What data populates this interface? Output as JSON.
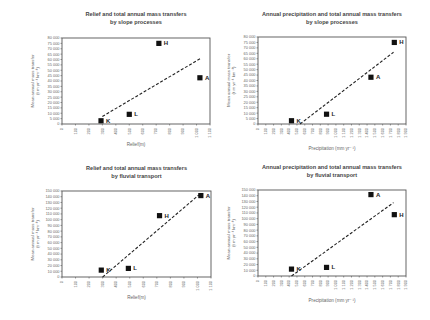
{
  "chart_data": [
    {
      "type": "scatter",
      "title": "Relief and total annual mass transfers by slope processes",
      "title_lines": [
        "Relief and total annual mass transfers",
        "by slope processes"
      ],
      "xlabel": "Relief(m)",
      "ylabel_lines": [
        "Mean annual mass transfer",
        "(t m yr⁻¹ km⁻¹)"
      ],
      "xlim": [
        0,
        1100
      ],
      "ylim": [
        0,
        80000
      ],
      "xticks": [
        0,
        100,
        200,
        300,
        400,
        500,
        600,
        700,
        800,
        900,
        1000,
        1100
      ],
      "yticks": [
        0,
        5000,
        10000,
        15000,
        20000,
        25000,
        30000,
        35000,
        40000,
        45000,
        50000,
        55000,
        60000,
        65000,
        70000,
        75000,
        80000
      ],
      "points": [
        {
          "label": "K",
          "x": 290,
          "y": 3000
        },
        {
          "label": "L",
          "x": 500,
          "y": 9000
        },
        {
          "label": "H",
          "x": 720,
          "y": 75000
        },
        {
          "label": "A",
          "x": 1025,
          "y": 43000
        }
      ],
      "trendline": {
        "x1": 300,
        "y1": 7000,
        "x2": 1030,
        "y2": 61000,
        "style": "dashed"
      },
      "grid": false,
      "legend": null
    },
    {
      "type": "scatter",
      "title": "Annual precipitation and total annual mass transfers by slope processes",
      "title_lines": [
        "Annual precipitation and total annual mass transfers",
        "by slope processes"
      ],
      "xlabel": "Precipitation (mm yr⁻¹)",
      "ylabel_lines": [
        "Mean annual mass transfer",
        "(t m yr⁻¹ km⁻¹)"
      ],
      "xlim": [
        0,
        1900
      ],
      "ylim": [
        0,
        80000
      ],
      "xticks": [
        0,
        100,
        200,
        300,
        400,
        500,
        600,
        700,
        800,
        900,
        1000,
        1100,
        1200,
        1300,
        1400,
        1500,
        1600,
        1700,
        1800,
        1900
      ],
      "yticks": [
        0,
        5000,
        10000,
        15000,
        20000,
        25000,
        30000,
        35000,
        40000,
        45000,
        50000,
        55000,
        60000,
        65000,
        70000,
        75000,
        80000
      ],
      "points": [
        {
          "label": "K",
          "x": 430,
          "y": 3000
        },
        {
          "label": "L",
          "x": 880,
          "y": 9000
        },
        {
          "label": "A",
          "x": 1450,
          "y": 43000
        },
        {
          "label": "H",
          "x": 1750,
          "y": 75000
        }
      ],
      "trendline": {
        "x1": 540,
        "y1": 0,
        "x2": 1740,
        "y2": 66000,
        "style": "dashed"
      },
      "grid": false,
      "legend": null
    },
    {
      "type": "scatter",
      "title": "Relief and total annual mass transfers by fluvial transport",
      "title_lines": [
        "Relief and total annual mass transfers",
        "by fluvial transport"
      ],
      "xlabel": "Relief(m)",
      "ylabel_lines": [
        "Mean annual mass transfer",
        "(t m yr⁻¹ km⁻¹)"
      ],
      "xlim": [
        0,
        1100
      ],
      "ylim": [
        0,
        150000
      ],
      "xticks": [
        0,
        100,
        200,
        300,
        400,
        500,
        600,
        700,
        800,
        900,
        1000,
        1100
      ],
      "yticks": [
        0,
        10000,
        20000,
        30000,
        40000,
        50000,
        60000,
        70000,
        80000,
        90000,
        100000,
        110000,
        120000,
        130000,
        140000,
        150000
      ],
      "points": [
        {
          "label": "K",
          "x": 290,
          "y": 12000
        },
        {
          "label": "L",
          "x": 490,
          "y": 15000
        },
        {
          "label": "H",
          "x": 720,
          "y": 107000
        },
        {
          "label": "A",
          "x": 1025,
          "y": 142000
        }
      ],
      "trendline": {
        "x1": 300,
        "y1": 0,
        "x2": 1010,
        "y2": 143000,
        "style": "dashed"
      },
      "grid": false,
      "legend": null
    },
    {
      "type": "scatter",
      "title": "Annual precipitation and total annual mass transfers by fluvial transport",
      "title_lines": [
        "Annual precipitation and total annual mass transfers",
        "by fluvial transport"
      ],
      "xlabel": "Precipitation (mm yr⁻¹)",
      "ylabel_lines": [
        "Mean annual mass transfer",
        "(t m yr⁻¹ km⁻¹)"
      ],
      "xlim": [
        0,
        1900
      ],
      "ylim": [
        0,
        150000
      ],
      "xticks": [
        0,
        100,
        200,
        300,
        400,
        500,
        600,
        700,
        800,
        900,
        1000,
        1100,
        1200,
        1300,
        1400,
        1500,
        1600,
        1700,
        1800,
        1900
      ],
      "yticks": [
        0,
        10000,
        20000,
        30000,
        40000,
        50000,
        60000,
        70000,
        80000,
        90000,
        100000,
        110000,
        120000,
        130000,
        140000,
        150000
      ],
      "points": [
        {
          "label": "K",
          "x": 430,
          "y": 12000
        },
        {
          "label": "L",
          "x": 880,
          "y": 15000
        },
        {
          "label": "A",
          "x": 1450,
          "y": 142000
        },
        {
          "label": "H",
          "x": 1750,
          "y": 107000
        }
      ],
      "trendline": {
        "x1": 430,
        "y1": 0,
        "x2": 1740,
        "y2": 128000,
        "style": "dashed"
      },
      "grid": false,
      "legend": null
    }
  ],
  "layout": {
    "frames": [
      {
        "left": 62,
        "top": 38,
        "right": 210,
        "bottom": 124
      },
      {
        "left": 258,
        "top": 37,
        "right": 406,
        "bottom": 124
      },
      {
        "left": 62,
        "top": 191,
        "right": 211,
        "bottom": 277
      },
      {
        "left": 258,
        "top": 190,
        "right": 406,
        "bottom": 276
      }
    ],
    "title_tops": [
      11,
      11,
      165,
      164
    ]
  }
}
